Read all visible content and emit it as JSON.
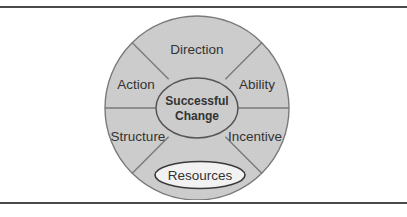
{
  "figure": {
    "title": "Successful Change",
    "hub": {
      "line1": "Successful",
      "line2": "Change"
    },
    "segments": [
      {
        "id": "direction",
        "label": "Direction"
      },
      {
        "id": "ability",
        "label": "Ability"
      },
      {
        "id": "incentive",
        "label": "Incentive"
      },
      {
        "id": "resources",
        "label": "Resources"
      },
      {
        "id": "structure",
        "label": "Structure"
      },
      {
        "id": "action",
        "label": "Action"
      }
    ],
    "highlighted_segment": "Resources",
    "colors": {
      "segment_fill": "#cccccc",
      "segment_stroke": "#7a7a7a",
      "hub_fill": "#cccccc",
      "hub_stroke": "#555555",
      "highlight_fill": "#f2f2f2",
      "highlight_stroke": "#3a3a3a",
      "text": "#333333",
      "rule": "#4a4a4a",
      "background": "#ffffff"
    }
  }
}
